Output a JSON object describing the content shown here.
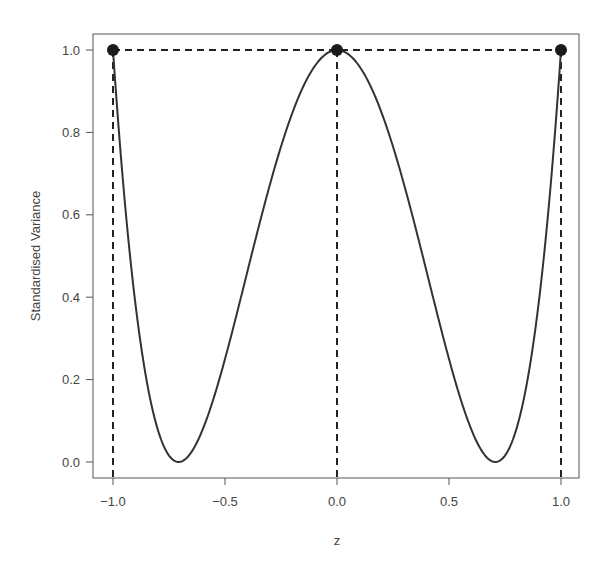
{
  "chart_data": {
    "type": "line",
    "title": "",
    "xlabel": "z",
    "ylabel": "Standardised Variance",
    "xlim": [
      -1.08,
      1.08
    ],
    "ylim": [
      -0.04,
      1.04
    ],
    "x_ticks": [
      -1.0,
      -0.5,
      0.0,
      0.5,
      1.0
    ],
    "x_tick_labels": [
      "-1.0",
      "-0.5",
      "0.0",
      "0.5",
      "1.0"
    ],
    "y_ticks": [
      0.0,
      0.2,
      0.4,
      0.6,
      0.8,
      1.0
    ],
    "y_tick_labels": [
      "0.0",
      "0.2",
      "0.4",
      "0.6",
      "0.8",
      "1.0"
    ],
    "grid": false,
    "legend": null,
    "series": [
      {
        "name": "standardised variance curve",
        "style": "solid",
        "color": "#333333",
        "function": "(1 - 2 z^2)^2",
        "x": [
          -1.0,
          -0.9,
          -0.8,
          -0.7071,
          -0.6,
          -0.5,
          -0.4,
          -0.3,
          -0.2,
          -0.1,
          0.0,
          0.1,
          0.2,
          0.3,
          0.4,
          0.5,
          0.6,
          0.7071,
          0.8,
          0.9,
          1.0
        ],
        "values": [
          1.0,
          0.384,
          0.078,
          0.0,
          0.078,
          0.25,
          0.462,
          0.672,
          0.846,
          0.96,
          1.0,
          0.96,
          0.846,
          0.672,
          0.462,
          0.25,
          0.078,
          0.0,
          0.078,
          0.384,
          1.0
        ]
      }
    ],
    "points": [
      {
        "x": -1.0,
        "y": 1.0
      },
      {
        "x": 0.0,
        "y": 1.0
      },
      {
        "x": 1.0,
        "y": 1.0
      }
    ],
    "reference_lines": [
      {
        "orientation": "horizontal",
        "y": 1.0,
        "from_x": -1.0,
        "to_x": 1.0,
        "style": "dashed"
      },
      {
        "orientation": "vertical",
        "x": -1.0,
        "style": "dashed"
      },
      {
        "orientation": "vertical",
        "x": 0.0,
        "style": "dashed"
      },
      {
        "orientation": "vertical",
        "x": 1.0,
        "style": "dashed"
      }
    ]
  }
}
